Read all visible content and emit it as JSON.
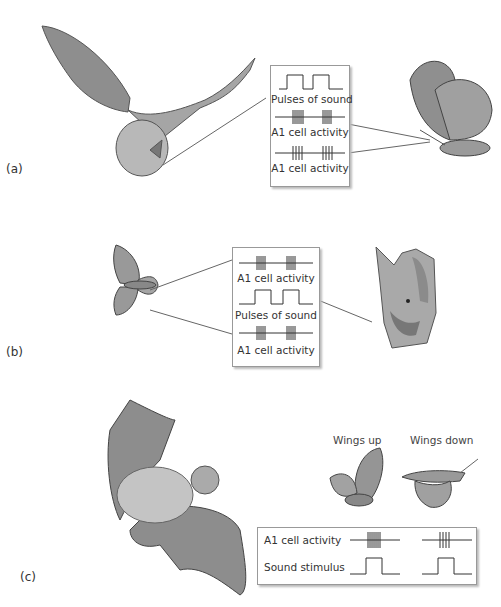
{
  "panels": [
    {
      "id": "a",
      "label": "(a)",
      "box_traces": [
        {
          "type": "sound",
          "label": "Pulses of sound"
        },
        {
          "type": "spikes",
          "label": "A1 cell activity"
        },
        {
          "type": "spikes",
          "label": "A1 cell activity"
        }
      ],
      "illustrations": [
        "bat-flying",
        "moth-resting"
      ]
    },
    {
      "id": "b",
      "label": "(b)",
      "box_traces": [
        {
          "type": "spikes",
          "label": "A1 cell activity"
        },
        {
          "type": "sound",
          "label": "Pulses of sound"
        },
        {
          "type": "spikes",
          "label": "A1 cell activity"
        }
      ],
      "illustrations": [
        "moth-spread",
        "bat-head"
      ]
    },
    {
      "id": "c",
      "label": "(c)",
      "captions": [
        "Wings up",
        "Wings down"
      ],
      "box_rows": [
        {
          "label": "A1 cell activity"
        },
        {
          "label": "Sound stimulus"
        }
      ],
      "illustrations": [
        "bat-flying-2",
        "moth-wings-up",
        "moth-wings-down"
      ]
    }
  ]
}
